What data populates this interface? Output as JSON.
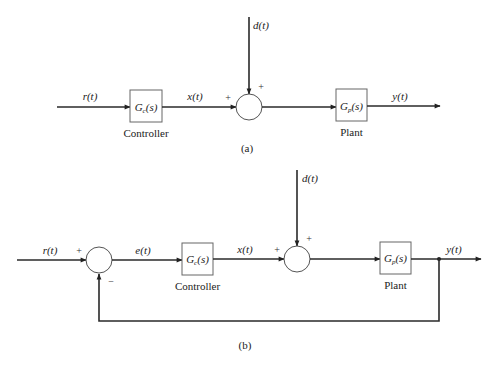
{
  "diagram_a": {
    "label": "(a)",
    "signals": {
      "input": "r(t)",
      "controller_out": "x(t)",
      "disturbance": "d(t)",
      "output": "y(t)"
    },
    "blocks": {
      "controller": {
        "tf": "G",
        "sub": "c",
        "arg": "(s)",
        "caption": "Controller"
      },
      "plant": {
        "tf": "G",
        "sub": "p",
        "arg": "(s)",
        "caption": "Plant"
      }
    },
    "summing_junction": {
      "left_sign": "+",
      "top_sign": "+"
    }
  },
  "diagram_b": {
    "label": "(b)",
    "signals": {
      "input": "r(t)",
      "error": "e(t)",
      "controller_out": "x(t)",
      "disturbance": "d(t)",
      "output": "y(t)"
    },
    "blocks": {
      "controller": {
        "tf": "G",
        "sub": "c",
        "arg": "(s)",
        "caption": "Controller"
      },
      "plant": {
        "tf": "G",
        "sub": "p",
        "arg": "(s)",
        "caption": "Plant"
      }
    },
    "summing_junction_1": {
      "left_sign": "+",
      "bottom_sign": "−"
    },
    "summing_junction_2": {
      "left_sign": "+",
      "top_sign": "+"
    }
  }
}
